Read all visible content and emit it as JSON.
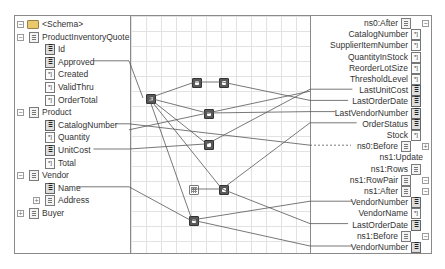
{
  "source_tree": {
    "root": {
      "label": "<Schema>",
      "icon": "folder-icon",
      "expanded": true
    },
    "items": [
      {
        "label": "ProductInventoryQuote",
        "icon": "element-icon",
        "level": 1,
        "toggle": "collapse"
      },
      {
        "label": "Id",
        "icon": "key-field-icon",
        "level": 2
      },
      {
        "label": "Approved",
        "icon": "key-field-icon",
        "level": 2,
        "linked": true
      },
      {
        "label": "Created",
        "icon": "attribute-icon",
        "level": 2
      },
      {
        "label": "ValidThru",
        "icon": "attribute-icon",
        "level": 2
      },
      {
        "label": "OrderTotal",
        "icon": "attribute-icon",
        "level": 2
      },
      {
        "label": "Product",
        "icon": "element-icon",
        "level": 1,
        "toggle": "collapse"
      },
      {
        "label": "CatalogNumber",
        "icon": "key-field-icon",
        "level": 2,
        "linked": true
      },
      {
        "label": "Quantity",
        "icon": "attribute-icon",
        "level": 2
      },
      {
        "label": "UnitCost",
        "icon": "key-field-icon",
        "level": 2,
        "linked": true
      },
      {
        "label": "Total",
        "icon": "attribute-icon",
        "level": 2
      },
      {
        "label": "Vendor",
        "icon": "element-icon",
        "level": 1,
        "toggle": "collapse"
      },
      {
        "label": "Name",
        "icon": "key-field-icon",
        "level": 2,
        "linked": true
      },
      {
        "label": "Address",
        "icon": "element-icon",
        "level": 2,
        "toggle": "expand"
      },
      {
        "label": "Buyer",
        "icon": "element-icon",
        "level": 1,
        "toggle": "expand"
      }
    ]
  },
  "destination_tree": {
    "items": [
      {
        "label": "ns0:After",
        "icon": "element-icon",
        "toggle": "collapse"
      },
      {
        "label": "CatalogNumber",
        "icon": "attribute-icon"
      },
      {
        "label": "SupplierItemNumber",
        "icon": "attribute-icon"
      },
      {
        "label": "QuantityInStock",
        "icon": "attribute-icon"
      },
      {
        "label": "ReorderLotSize",
        "icon": "attribute-icon"
      },
      {
        "label": "ThresholdLevel",
        "icon": "attribute-icon"
      },
      {
        "label": "LastUnitCost",
        "icon": "key-field-icon",
        "linked": true
      },
      {
        "label": "LastOrderDate",
        "icon": "key-field-icon",
        "linked": true
      },
      {
        "label": "LastVendorNumber",
        "icon": "key-field-icon",
        "linked": true
      },
      {
        "label": "OrderStatus",
        "icon": "key-field-icon",
        "linked": true
      },
      {
        "label": "Stock",
        "icon": "attribute-icon"
      },
      {
        "label": "ns0:Before",
        "icon": "element-icon",
        "toggle": "expand",
        "dashed_link": true
      },
      {
        "label": "ns1:Update",
        "icon": "none"
      },
      {
        "label": "ns1:Rows",
        "icon": "element-icon"
      },
      {
        "label": "ns1:RowPair",
        "icon": "element-icon",
        "toggle": "collapse"
      },
      {
        "label": "ns1:After",
        "icon": "element-icon",
        "toggle": "collapse"
      },
      {
        "label": "VendorNumber",
        "icon": "key-field-icon",
        "linked": true
      },
      {
        "label": "VendorName",
        "icon": "attribute-icon"
      },
      {
        "label": "LastOrderDate",
        "icon": "key-field-icon",
        "linked": true
      },
      {
        "label": "ns1:Before",
        "icon": "element-icon",
        "toggle": "collapse"
      },
      {
        "label": "VendorNumber",
        "icon": "key-field-icon",
        "linked": true
      }
    ]
  },
  "functoids": [
    {
      "name": "functoid-logical",
      "kind": "logical"
    },
    {
      "name": "functoid-string-1",
      "kind": "string"
    },
    {
      "name": "functoid-script-1",
      "kind": "script"
    },
    {
      "name": "functoid-script-2",
      "kind": "script"
    },
    {
      "name": "functoid-script-3",
      "kind": "script"
    },
    {
      "name": "functoid-table",
      "kind": "table"
    },
    {
      "name": "functoid-script-4",
      "kind": "script"
    },
    {
      "name": "functoid-script-5",
      "kind": "script"
    }
  ]
}
